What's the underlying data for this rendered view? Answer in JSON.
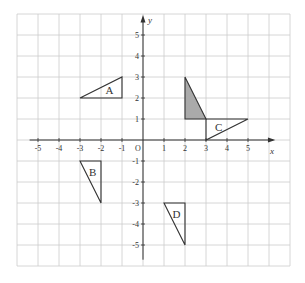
{
  "diagram": {
    "type": "coordinate-grid-transformations",
    "grid": {
      "x_min": -6,
      "x_max": 7,
      "y_min": -6,
      "y_max": 6,
      "unit_px": 21,
      "origin_px": [
        143,
        140
      ]
    },
    "axes": {
      "x_label": "x",
      "y_label": "y",
      "origin_label": "O",
      "x_ticks": [
        "-5",
        "-4",
        "-3",
        "-2",
        "-1",
        "1",
        "2",
        "3",
        "4",
        "5"
      ],
      "x_tick_values": [
        -5,
        -4,
        -3,
        -2,
        -1,
        1,
        2,
        3,
        4,
        5
      ],
      "y_ticks": [
        "5",
        "4",
        "3",
        "2",
        "1",
        "-1",
        "-2",
        "-3",
        "-4",
        "-5"
      ],
      "y_tick_values": [
        5,
        4,
        3,
        2,
        1,
        -1,
        -2,
        -3,
        -4,
        -5
      ]
    },
    "shapes": [
      {
        "name": "shaded",
        "label": "",
        "points": [
          [
            2,
            3
          ],
          [
            2,
            1
          ],
          [
            3,
            1
          ]
        ],
        "fill": "#aaaaaa",
        "label_pos": null
      },
      {
        "name": "A",
        "label": "A",
        "points": [
          [
            -3,
            2
          ],
          [
            -1,
            3
          ],
          [
            -1,
            2
          ]
        ],
        "fill": "none",
        "label_pos": [
          -1.6,
          2.4
        ]
      },
      {
        "name": "B",
        "label": "B",
        "points": [
          [
            -3,
            -1
          ],
          [
            -2,
            -1
          ],
          [
            -2,
            -3
          ]
        ],
        "fill": "none",
        "label_pos": [
          -2.4,
          -1.5
        ]
      },
      {
        "name": "C",
        "label": "C",
        "points": [
          [
            3,
            1
          ],
          [
            5,
            1
          ],
          [
            3,
            0
          ]
        ],
        "fill": "none",
        "label_pos": [
          3.6,
          0.6
        ]
      },
      {
        "name": "D",
        "label": "D",
        "points": [
          [
            1,
            -3
          ],
          [
            2,
            -3
          ],
          [
            2,
            -5
          ]
        ],
        "fill": "none",
        "label_pos": [
          1.6,
          -3.5
        ]
      }
    ],
    "colors": {
      "grid": "#cccccc",
      "axis": "#333333",
      "shape_stroke": "#333333",
      "shaded_fill": "#aaaaaa",
      "border": "#cccccc"
    }
  }
}
